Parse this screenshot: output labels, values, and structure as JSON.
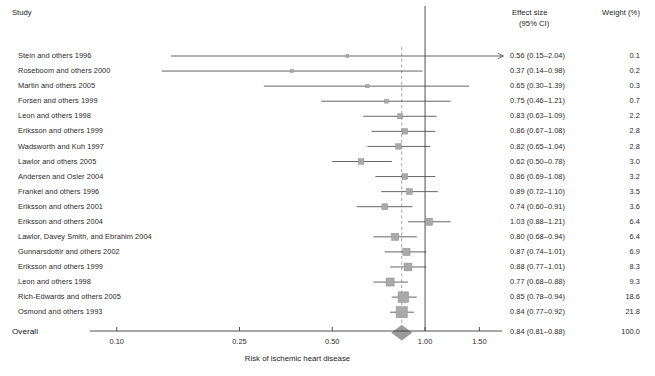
{
  "header": {
    "study_label": "Study",
    "effect_size_line1": "Effect size",
    "effect_size_line2": "(95% CI)",
    "weight_label": "Weight (%)"
  },
  "axis": {
    "title": "Risk of ischemic heart disease",
    "scale": "log",
    "ticks": [
      {
        "value": 0.1,
        "label": "0.10"
      },
      {
        "value": 0.25,
        "label": "0.25"
      },
      {
        "value": 0.5,
        "label": "0.50"
      },
      {
        "value": 1.0,
        "label": "1.00"
      },
      {
        "value": 1.5,
        "label": "1.50"
      }
    ],
    "xlim": [
      0.085,
      1.75
    ],
    "null_line": 1.0,
    "pooled_line": 0.84
  },
  "colors": {
    "marker": "#a9a9a9",
    "marker_stroke": "#8f8f8f",
    "diamond": "#9a9a9a",
    "ci_line": "#4a4a4a",
    "axis": "#3a3a3a",
    "null_line": "#3a3a3a",
    "dashed_line": "#9a9a9a",
    "text": "#2a2a2a"
  },
  "chart_data": {
    "type": "forest",
    "title": "",
    "xlabel": "Risk of ischemic heart disease",
    "ylabel": "",
    "xlim": [
      0.085,
      1.75
    ],
    "xscale": "log",
    "xticks": [
      0.1,
      0.25,
      0.5,
      1.0,
      1.5
    ],
    "grid": false,
    "legend": "none",
    "null_value": 1.0,
    "pooled_reference": 0.84,
    "columns": [
      "Study",
      "Effect size (95% CI)",
      "Weight (%)"
    ],
    "rows": [
      {
        "study": "Stein and others 1996",
        "estimate": 0.56,
        "low": 0.15,
        "high": 2.04,
        "es_text": "0.56 (0.15–2.04)",
        "weight": 0.1,
        "weight_text": "0.1"
      },
      {
        "study": "Roseboom and others 2000",
        "estimate": 0.37,
        "low": 0.14,
        "high": 0.98,
        "es_text": "0.37 (0.14–0.98)",
        "weight": 0.2,
        "weight_text": "0.2"
      },
      {
        "study": "Martin and others 2005",
        "estimate": 0.65,
        "low": 0.3,
        "high": 1.39,
        "es_text": "0.65 (0.30–1.39)",
        "weight": 0.3,
        "weight_text": "0.3"
      },
      {
        "study": "Forsen and others 1999",
        "estimate": 0.75,
        "low": 0.46,
        "high": 1.21,
        "es_text": "0.75 (0.46–1.21)",
        "weight": 0.7,
        "weight_text": "0.7"
      },
      {
        "study": "Leon and others 1998",
        "estimate": 0.83,
        "low": 0.63,
        "high": 1.09,
        "es_text": "0.83 (0.63–1.09)",
        "weight": 2.2,
        "weight_text": "2.2"
      },
      {
        "study": "Eriksson and others 1999",
        "estimate": 0.86,
        "low": 0.67,
        "high": 1.08,
        "es_text": "0.86 (0.67–1.08)",
        "weight": 2.8,
        "weight_text": "2.8"
      },
      {
        "study": "Wadsworth and Kuh 1997",
        "estimate": 0.82,
        "low": 0.65,
        "high": 1.04,
        "es_text": "0.82 (0.65–1.04)",
        "weight": 2.8,
        "weight_text": "2.8"
      },
      {
        "study": "Lawlor and others 2005",
        "estimate": 0.62,
        "low": 0.5,
        "high": 0.78,
        "es_text": "0.62 (0.50–0.78)",
        "weight": 3.0,
        "weight_text": "3.0"
      },
      {
        "study": "Andersen and Osler 2004",
        "estimate": 0.86,
        "low": 0.69,
        "high": 1.08,
        "es_text": "0.86 (0.69–1.08)",
        "weight": 3.2,
        "weight_text": "3.2"
      },
      {
        "study": "Frankel and others 1996",
        "estimate": 0.89,
        "low": 0.72,
        "high": 1.1,
        "es_text": "0.89 (0.72–1.10)",
        "weight": 3.5,
        "weight_text": "3.5"
      },
      {
        "study": "Eriksson and others 2001",
        "estimate": 0.74,
        "low": 0.6,
        "high": 0.91,
        "es_text": "0.74 (0.60–0.91)",
        "weight": 3.6,
        "weight_text": "3.6"
      },
      {
        "study": "Eriksson and others 2004",
        "estimate": 1.03,
        "low": 0.88,
        "high": 1.21,
        "es_text": "1.03 (0.88–1.21)",
        "weight": 6.4,
        "weight_text": "6.4"
      },
      {
        "study": "Lawlor, Davey Smith, and Ebrahim 2004",
        "estimate": 0.8,
        "low": 0.68,
        "high": 0.94,
        "es_text": "0.80 (0.68–0.94)",
        "weight": 6.4,
        "weight_text": "6.4"
      },
      {
        "study": "Gunnarsdottir and others 2002",
        "estimate": 0.87,
        "low": 0.74,
        "high": 1.01,
        "es_text": "0.87 (0.74–1.01)",
        "weight": 6.9,
        "weight_text": "6.9"
      },
      {
        "study": "Eriksson and others 1999",
        "estimate": 0.88,
        "low": 0.77,
        "high": 1.01,
        "es_text": "0.88 (0.77–1.01)",
        "weight": 8.3,
        "weight_text": "8.3"
      },
      {
        "study": "Leon and others 1998",
        "estimate": 0.77,
        "low": 0.68,
        "high": 0.88,
        "es_text": "0.77 (0.68–0.88)",
        "weight": 9.3,
        "weight_text": "9.3"
      },
      {
        "study": "Rich-Edwards and others 2005",
        "estimate": 0.85,
        "low": 0.78,
        "high": 0.94,
        "es_text": "0.85 (0.78–0.94)",
        "weight": 18.6,
        "weight_text": "18.6"
      },
      {
        "study": "Osmond and others 1993",
        "estimate": 0.84,
        "low": 0.77,
        "high": 0.92,
        "es_text": "0.84 (0.77–0.92)",
        "weight": 21.8,
        "weight_text": "21.8"
      }
    ],
    "overall": {
      "study": "Overall",
      "estimate": 0.84,
      "low": 0.81,
      "high": 0.88,
      "es_text": "0.84 (0.81–0.88)",
      "weight": 100.0,
      "weight_text": "100.0"
    }
  }
}
